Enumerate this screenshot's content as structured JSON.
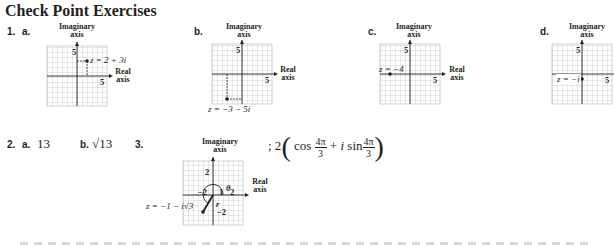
{
  "title": "Check Point Exercises",
  "exercise1": {
    "number": "1.",
    "parts": [
      {
        "label": "a.",
        "point_label": "z = 2 + 3i",
        "point": [
          2,
          3
        ],
        "tick_label_x": "5",
        "tick_label_y": "5"
      },
      {
        "label": "b.",
        "point_label": "z = −3 − 5i",
        "point": [
          -3,
          -5
        ],
        "tick_label_x": "5",
        "tick_label_y": "5"
      },
      {
        "label": "c.",
        "point_label": "z = −4",
        "point": [
          -4,
          0
        ],
        "tick_label_x": "5",
        "tick_label_y": "5"
      },
      {
        "label": "d.",
        "point_label": "z = −i",
        "point": [
          0,
          -1
        ],
        "tick_label_x": "5",
        "tick_label_y": "5"
      }
    ],
    "axis_imag_line1": "Imaginary",
    "axis_imag_line2": "axis",
    "axis_real_line1": "Real",
    "axis_real_line2": "axis"
  },
  "exercise2": {
    "number": "2.",
    "a_label": "a.",
    "a_value": "13",
    "b_label": "b.",
    "b_value": "√13"
  },
  "exercise3": {
    "number": "3.",
    "point_label": "z = −1 − i√3",
    "theta": "θ",
    "r": "r",
    "tick_2_top": "2",
    "tick_neg2_left": "−2",
    "tick_1": "1",
    "tick_2_right": "2",
    "tick_neg2_bottom": "−2",
    "answer_prefix": "; 2",
    "cos": "cos",
    "plus": "+",
    "i": "i",
    "sin": "sin",
    "frac_num": "4π",
    "frac_den": "3"
  }
}
